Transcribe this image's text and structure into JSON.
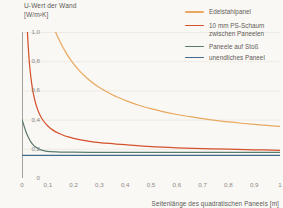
{
  "chart_data": {
    "type": "line",
    "title": "",
    "ylabel": "U-Wert der Wand\n[W/m²K]",
    "ylabel_line1": "U-Wert der Wand",
    "ylabel_line2": "[W/m²K]",
    "xlabel": "Seitenlänge des quadratischen Paneels [m]",
    "xlim": [
      0,
      1
    ],
    "ylim": [
      0,
      1
    ],
    "grid": "horizontal",
    "legend_position": "top-right",
    "yticks": [
      "0",
      "0,2",
      "0,4",
      "0,6",
      "0,8",
      "1,0"
    ],
    "ytick_values": [
      0,
      0.2,
      0.4,
      0.6,
      0.8,
      1.0
    ],
    "xticks": [
      "0",
      "0,1",
      "0,2",
      "0,3",
      "0,4",
      "0,5",
      "0,6",
      "0,7",
      "0,8",
      "0,9",
      "1"
    ],
    "xtick_values": [
      0,
      0.1,
      0.2,
      0.3,
      0.4,
      0.5,
      0.6,
      0.7,
      0.8,
      0.9,
      1.0
    ],
    "series": [
      {
        "name": "Edelstahlpanel",
        "color": "#e9a85f",
        "asymptote": 0.255,
        "x": [
          0.13,
          0.15,
          0.175,
          0.2,
          0.225,
          0.25,
          0.275,
          0.3,
          0.35,
          0.4,
          0.45,
          0.5,
          0.55,
          0.6,
          0.65,
          0.7,
          0.75,
          0.8,
          0.85,
          0.9,
          0.95,
          1.0
        ],
        "values": [
          1.0,
          0.925,
          0.845,
          0.782,
          0.73,
          0.687,
          0.651,
          0.62,
          0.57,
          0.532,
          0.5,
          0.475,
          0.453,
          0.435,
          0.42,
          0.406,
          0.395,
          0.384,
          0.375,
          0.367,
          0.36,
          0.353
        ]
      },
      {
        "name": "10 mm PS-Schaum\nzwischen Paneelen",
        "color": "#d4522c",
        "asymptote": 0.175,
        "x": [
          0.021,
          0.025,
          0.03,
          0.04,
          0.05,
          0.06,
          0.07,
          0.08,
          0.1,
          0.12,
          0.14,
          0.16,
          0.18,
          0.2,
          0.25,
          0.3,
          0.35,
          0.4,
          0.5,
          0.6,
          0.7,
          0.8,
          0.9,
          1.0
        ],
        "values": [
          1.0,
          0.878,
          0.762,
          0.617,
          0.53,
          0.472,
          0.43,
          0.399,
          0.356,
          0.328,
          0.308,
          0.293,
          0.281,
          0.272,
          0.255,
          0.243,
          0.235,
          0.228,
          0.215,
          0.207,
          0.202,
          0.197,
          0.193,
          0.19
        ]
      },
      {
        "name": "Paneele auf Stoß",
        "color": "#5b7c6d",
        "asymptote": 0.172,
        "x": [
          0.0,
          0.005,
          0.01,
          0.015,
          0.02,
          0.025,
          0.03,
          0.035,
          0.04,
          0.05,
          0.06,
          0.07,
          0.08,
          0.1,
          0.15,
          0.2,
          0.3,
          0.4,
          0.5,
          0.6,
          0.8,
          1.0
        ],
        "values": [
          0.4,
          0.373,
          0.345,
          0.318,
          0.296,
          0.277,
          0.26,
          0.246,
          0.234,
          0.216,
          0.204,
          0.195,
          0.189,
          0.182,
          0.178,
          0.177,
          0.176,
          0.176,
          0.176,
          0.175,
          0.175,
          0.175
        ]
      },
      {
        "name": "unendliches Paneel",
        "color": "#40698f",
        "asymptote": 0.155,
        "x": [
          0.0,
          1.0
        ],
        "values": [
          0.155,
          0.155
        ]
      }
    ]
  },
  "legend": {
    "items": [
      {
        "label": "Edelstahlpanel",
        "color": "#e9a85f"
      },
      {
        "label": "10 mm PS-Schaum\nzwischen Paneelen",
        "color": "#d4522c"
      },
      {
        "label": "Paneele auf Stoß",
        "color": "#5b7c6d"
      },
      {
        "label": "unendliches Paneel",
        "color": "#40698f"
      }
    ]
  }
}
